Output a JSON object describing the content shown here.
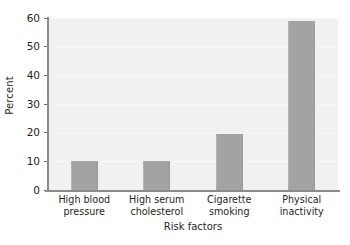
{
  "chart_data": {
    "type": "bar",
    "title": "",
    "subtitle": "",
    "xlabel": "Risk factors",
    "ylabel": "Percent",
    "categories": [
      "High blood pressure",
      "High serum cholesterol",
      "Cigarette smoking",
      "Physical inactivity"
    ],
    "category_lines": [
      [
        "High blood",
        "pressure"
      ],
      [
        "High serum",
        "cholesterol"
      ],
      [
        "Cigarette",
        "smoking"
      ],
      [
        "Physical",
        "inactivity"
      ]
    ],
    "values": [
      10,
      10,
      19.5,
      59
    ],
    "ylim": [
      0,
      60
    ],
    "ytick_values": [
      0,
      10,
      20,
      30,
      40,
      50,
      60
    ],
    "ytick_labels": [
      "0",
      "10",
      "20",
      "30",
      "40",
      "50",
      "60"
    ],
    "grid": true,
    "grid_axis": "y",
    "legend": false,
    "legend_position": "none",
    "bar_color": "#a3a3a3",
    "plot_background": "#f1f1f1",
    "axis_color": "#8a8a8a",
    "gridline_color": "#f7f7f7",
    "text_color": "#231f20"
  }
}
